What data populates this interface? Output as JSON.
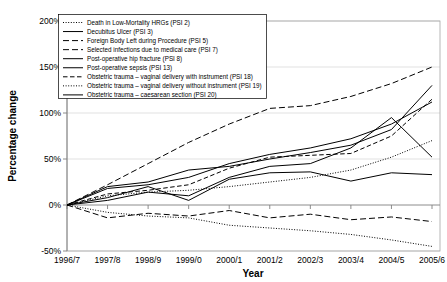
{
  "chart_data": {
    "type": "line",
    "title": "",
    "xlabel": "Year",
    "ylabel": "Percentage change",
    "categories": [
      "1996/7",
      "1997/8",
      "1998/9",
      "1999/0",
      "2000/1",
      "2001/2",
      "2002/3",
      "2003/4",
      "2004/5",
      "2005/6"
    ],
    "x_tick_labels": [
      "1996/7",
      "1997/8",
      "1998/9",
      "1999/0",
      "2000/1",
      "2001/2",
      "2002/3",
      "2003/4",
      "2004/5",
      "2005/6"
    ],
    "y_tick_labels": [
      "200%",
      "150%",
      "100%",
      "50%",
      "0%",
      "-50%"
    ],
    "y_tick_values": [
      200,
      150,
      100,
      50,
      0,
      -50
    ],
    "ylim": [
      -50,
      200
    ],
    "grid": true,
    "legend_position": "top-left-inside",
    "series": [
      {
        "name": "Death in Low-Mortality HRGs (PSI 2)",
        "psi": "PSI 2",
        "style": "dotted",
        "values": [
          0,
          -8,
          -12,
          -14,
          -22,
          -25,
          -28,
          -32,
          -38,
          -45
        ]
      },
      {
        "name": "Decubitus Ulcer (PSI 3)",
        "psi": "PSI 3",
        "style": "solid",
        "values": [
          0,
          18,
          22,
          30,
          45,
          55,
          62,
          72,
          88,
          112
        ]
      },
      {
        "name": "Foreign Body Left during Procedure (PSI 5)",
        "psi": "PSI 5",
        "style": "dashed-long",
        "values": [
          0,
          -14,
          -9,
          -12,
          -6,
          -14,
          -10,
          -16,
          -13,
          -18
        ]
      },
      {
        "name": "Selected infections due to medical care (PSI 7)",
        "psi": "PSI 7",
        "style": "dashed-long",
        "values": [
          0,
          22,
          45,
          68,
          88,
          105,
          108,
          118,
          132,
          150
        ]
      },
      {
        "name": "Post-operative hip fracture (PSI 8)",
        "psi": "PSI 8",
        "style": "solid",
        "values": [
          0,
          5,
          14,
          10,
          30,
          42,
          45,
          62,
          95,
          52
        ]
      },
      {
        "name": "Post-operative sepsis (PSI 13)",
        "psi": "PSI 13",
        "style": "solid",
        "values": [
          0,
          20,
          25,
          38,
          42,
          50,
          57,
          65,
          82,
          130
        ]
      },
      {
        "name": "Obstetric trauma – vaginal delivery with instrument (PSI 18)",
        "psi": "PSI 18",
        "style": "dashed-medium",
        "values": [
          0,
          12,
          16,
          22,
          40,
          52,
          54,
          56,
          75,
          115
        ]
      },
      {
        "name": "Obstetric trauma – vaginal delivery without instrument (PSI 19)",
        "psi": "PSI 19",
        "style": "dotted",
        "values": [
          0,
          10,
          14,
          16,
          20,
          25,
          30,
          38,
          52,
          70
        ]
      },
      {
        "name": "Obstetric trauma – caesarean section (PSI 20)",
        "psi": "PSI 20",
        "style": "solid",
        "values": [
          0,
          8,
          20,
          5,
          28,
          35,
          36,
          26,
          35,
          33
        ]
      }
    ]
  },
  "axes": {
    "ylabel": "Percentage change",
    "xlabel": "Year"
  }
}
